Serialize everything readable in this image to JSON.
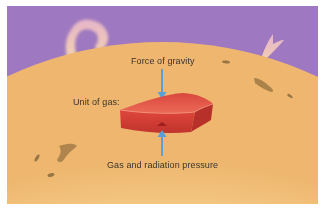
{
  "diagram": {
    "labels": {
      "gravity": "Force of gravity",
      "unit": "Unit of gas:",
      "pressure": "Gas and radiation pressure"
    },
    "colors": {
      "sky": "#9e78c0",
      "sun_edge": "#f0bd74",
      "sun_core": "#fdf8c8",
      "block_top": "#e35a4c",
      "block_front": "#cf3b33",
      "arrow": "#5b9fd8",
      "prominence": "#f4c7b3",
      "sunspot": "#8a6a3a"
    },
    "elements": [
      "purple-space-background",
      "sun-surface",
      "solar-prominence-left",
      "solar-prominence-right",
      "sunspots",
      "gas-block",
      "gravity-arrow-down",
      "pressure-arrow-up"
    ]
  }
}
